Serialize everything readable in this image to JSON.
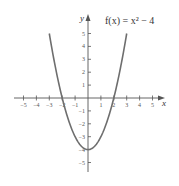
{
  "chart_data": {
    "type": "line",
    "title": "f(x) = x² − 4",
    "function": "x^2 - 4",
    "xlabel": "x",
    "ylabel": "y",
    "xlim": [
      -5,
      5
    ],
    "ylim": [
      -5,
      5
    ],
    "x_ticks": [
      -5,
      -4,
      -3,
      -2,
      -1,
      1,
      2,
      3,
      4,
      5
    ],
    "y_ticks": [
      -5,
      -4,
      -3,
      -2,
      -1,
      1,
      2,
      3,
      4,
      5
    ],
    "grid": false,
    "series": [
      {
        "name": "f(x) = x² − 4",
        "x": [
          -3,
          -2.5,
          -2,
          -1.5,
          -1,
          -0.5,
          0,
          0.5,
          1,
          1.5,
          2,
          2.5,
          3
        ],
        "y": [
          5,
          2.25,
          0,
          -1.75,
          -3,
          -3.75,
          -4,
          -3.75,
          -3,
          -1.75,
          0,
          2.25,
          5
        ]
      }
    ],
    "curve_x_range": [
      -3,
      3
    ],
    "key_points": {
      "vertex": [
        0,
        -4
      ],
      "x_intercepts": [
        [
          -2,
          0
        ],
        [
          2,
          0
        ]
      ]
    },
    "colors": {
      "curve": "#6e6e6e",
      "axes": "#555555"
    }
  },
  "labels": {
    "title": "f(x) = x² − 4",
    "x_axis": "x",
    "y_axis": "y"
  }
}
